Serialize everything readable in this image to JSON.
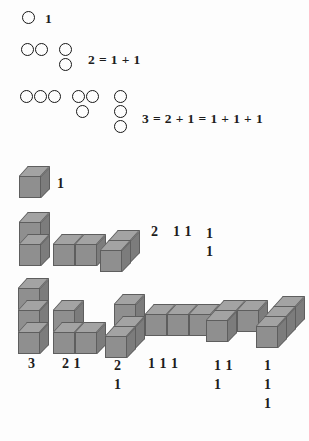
{
  "figure": {
    "background_color": "#fdfdfd",
    "ink_color": "#1c1c1c",
    "cube_colors": {
      "top": "#a3a3a3",
      "front": "#8f8f8f",
      "side": "#7c7c7c",
      "edge": "#5e5e5e"
    }
  },
  "circle_section": {
    "rows": [
      {
        "id": "row-1",
        "groups": [
          {
            "id": "g1-a",
            "layout": "single",
            "count": 1
          }
        ],
        "equation": "1"
      },
      {
        "id": "row-2",
        "groups": [
          {
            "id": "g2-a",
            "layout": "horizontal-2",
            "count": 2
          },
          {
            "id": "g2-b",
            "layout": "vertical-2",
            "count": 2
          }
        ],
        "equation": "2 = 1 + 1"
      },
      {
        "id": "row-3",
        "groups": [
          {
            "id": "g3-a",
            "layout": "horizontal-3",
            "count": 3
          },
          {
            "id": "g3-b",
            "layout": "two-over-one",
            "count": 3
          },
          {
            "id": "g3-c",
            "layout": "vertical-3",
            "count": 3
          }
        ],
        "equation": "3 = 2 + 1 = 1 + 1 + 1"
      }
    ]
  },
  "cube_section": {
    "rows": [
      {
        "id": "cube-row-1",
        "n": 1,
        "shapes": [
          {
            "id": "c1-a",
            "name": "single-cube",
            "cubes": 1
          }
        ],
        "labels": [
          {
            "id": "lbl-1-a",
            "lines": [
              "1"
            ]
          }
        ]
      },
      {
        "id": "cube-row-2",
        "n": 2,
        "shapes": [
          {
            "id": "c2-a",
            "name": "vertical-stack-2",
            "cubes": 2
          },
          {
            "id": "c2-b",
            "name": "horizontal-pair-2",
            "cubes": 2
          },
          {
            "id": "c2-c",
            "name": "depth-pair-2",
            "cubes": 2
          }
        ],
        "labels": [
          {
            "id": "lbl-2-a",
            "lines": [
              "2"
            ]
          },
          {
            "id": "lbl-2-b",
            "lines": [
              "1 1"
            ]
          },
          {
            "id": "lbl-2-c",
            "lines": [
              "1",
              "1"
            ]
          }
        ]
      },
      {
        "id": "cube-row-3",
        "n": 3,
        "shapes": [
          {
            "id": "c3-a",
            "name": "vertical-stack-3",
            "cubes": 3
          },
          {
            "id": "c3-b",
            "name": "L-shape-two-tall-one-right",
            "cubes": 3
          },
          {
            "id": "c3-c",
            "name": "L-shape-two-tall-one-front",
            "cubes": 3
          },
          {
            "id": "c3-d",
            "name": "horizontal-row-3",
            "cubes": 3
          },
          {
            "id": "c3-e",
            "name": "L-shape-two-wide-one-back",
            "cubes": 3
          },
          {
            "id": "c3-f",
            "name": "depth-stack-3",
            "cubes": 3
          }
        ],
        "labels": [
          {
            "id": "lbl-3-a",
            "lines": [
              "3"
            ]
          },
          {
            "id": "lbl-3-b",
            "lines": [
              "2 1"
            ]
          },
          {
            "id": "lbl-3-c",
            "lines": [
              "2",
              "1"
            ]
          },
          {
            "id": "lbl-3-d",
            "lines": [
              "1 1 1"
            ]
          },
          {
            "id": "lbl-3-e",
            "lines": [
              "1 1",
              "1"
            ]
          },
          {
            "id": "lbl-3-f",
            "lines": [
              "1",
              "1",
              "1"
            ]
          }
        ]
      }
    ]
  },
  "text_items": {
    "row1_equation": "1",
    "row2_equation": "2 = 1 + 1",
    "row3_equation": "3 = 2 + 1 = 1 + 1 + 1",
    "cube1_label": "1",
    "cube2_label_a": "2",
    "cube2_label_b": "1 1",
    "cube2_label_c_line1": "1",
    "cube2_label_c_line2": "1",
    "cube3_label_a": "3",
    "cube3_label_b": "2 1",
    "cube3_label_c_line1": "2",
    "cube3_label_c_line2": "1",
    "cube3_label_d": "1 1 1",
    "cube3_label_e_line1": "1 1",
    "cube3_label_e_line2": "1",
    "cube3_label_f_line1": "1",
    "cube3_label_f_line2": "1",
    "cube3_label_f_line3": "1"
  }
}
